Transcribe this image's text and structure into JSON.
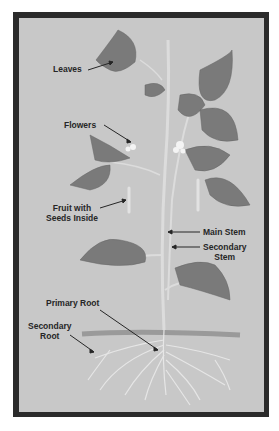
{
  "colors": {
    "frame": "#2b2b2b",
    "background": "#c8c8c8",
    "leaf": "#7a7a7a",
    "stem": "#dcdcdc",
    "soil": "#9a9a9a"
  },
  "labels": {
    "leaves": "Leaves",
    "flowers": "Flowers",
    "fruit_line1": "Fruit with",
    "fruit_line2": "Seeds Inside",
    "main_stem": "Main Stem",
    "secondary_stem_line1": "Secondary",
    "secondary_stem_line2": "Stem",
    "primary_root": "Primary Root",
    "secondary_root_line1": "Secondary",
    "secondary_root_line2": "Root"
  }
}
